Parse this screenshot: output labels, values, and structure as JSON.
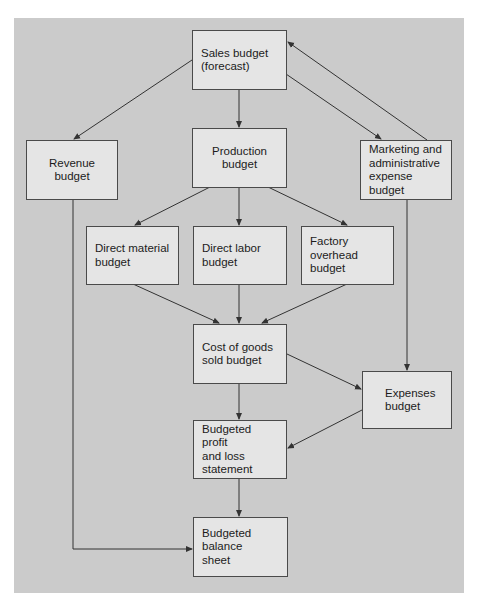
{
  "diagram": {
    "type": "flowchart",
    "colors": {
      "background": "#cbcbcb",
      "box_fill": "#e5e5e5",
      "box_border": "#4a4a4a",
      "arrow": "#333333"
    },
    "nodes": [
      {
        "id": "sales",
        "label": "Sales budget\n(forecast)"
      },
      {
        "id": "revenue",
        "label": "Revenue budget"
      },
      {
        "id": "production",
        "label": "Production budget"
      },
      {
        "id": "marketing",
        "label": "Marketing and\nadministrative\nexpense budget"
      },
      {
        "id": "direct_material",
        "label": "Direct material\nbudget"
      },
      {
        "id": "direct_labor",
        "label": "Direct labor\nbudget"
      },
      {
        "id": "factory_overhead",
        "label": "Factory\noverhead\nbudget"
      },
      {
        "id": "cogs",
        "label": "Cost of goods\nsold budget"
      },
      {
        "id": "expenses",
        "label": "Expenses\nbudget"
      },
      {
        "id": "profit_loss",
        "label": "Budgeted profit\nand loss\nstatement"
      },
      {
        "id": "balance_sheet",
        "label": "Budgeted balance\nsheet"
      }
    ],
    "edges": [
      {
        "from": "sales",
        "to": "revenue"
      },
      {
        "from": "sales",
        "to": "production"
      },
      {
        "from": "sales",
        "to": "marketing"
      },
      {
        "from": "marketing",
        "to": "sales"
      },
      {
        "from": "production",
        "to": "direct_material"
      },
      {
        "from": "production",
        "to": "direct_labor"
      },
      {
        "from": "production",
        "to": "factory_overhead"
      },
      {
        "from": "direct_material",
        "to": "cogs"
      },
      {
        "from": "direct_labor",
        "to": "cogs"
      },
      {
        "from": "factory_overhead",
        "to": "cogs"
      },
      {
        "from": "cogs",
        "to": "expenses"
      },
      {
        "from": "marketing",
        "to": "expenses"
      },
      {
        "from": "cogs",
        "to": "profit_loss"
      },
      {
        "from": "expenses",
        "to": "profit_loss"
      },
      {
        "from": "profit_loss",
        "to": "balance_sheet"
      },
      {
        "from": "revenue",
        "to": "balance_sheet"
      }
    ]
  }
}
